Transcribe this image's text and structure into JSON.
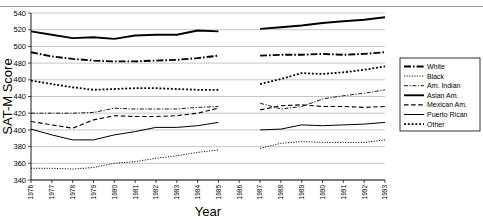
{
  "page": {
    "partial_caption_top": ""
  },
  "axes": {
    "ylabel": "SAT-M Score",
    "xlabel": "Year",
    "ylim": [
      340,
      540
    ],
    "yticks": [
      340,
      360,
      380,
      400,
      420,
      440,
      460,
      480,
      500,
      520,
      540
    ],
    "xticks": [
      "1976",
      "1977",
      "1978",
      "1979",
      "1980",
      "1981",
      "1982",
      "1983",
      "1984",
      "1985",
      "1986",
      "1987",
      "1988",
      "1989",
      "1990",
      "1991",
      "1992",
      "1993"
    ]
  },
  "legend": {
    "position": "right",
    "items": [
      {
        "label": "White",
        "style": "dash-dot-thick"
      },
      {
        "label": "Black",
        "style": "dotted-fine"
      },
      {
        "label": "Am. Indian",
        "style": "dash-dot-thin"
      },
      {
        "label": "Asian Am.",
        "style": "solid-thick"
      },
      {
        "label": "Mexican Am.",
        "style": "dashed"
      },
      {
        "label": "Puerto Rican",
        "style": "solid-thin"
      },
      {
        "label": "Other",
        "style": "dotted-square"
      }
    ]
  },
  "chart_data": {
    "type": "line",
    "title": "",
    "xlabel": "Year",
    "ylabel": "SAT-M Score",
    "ylim": [
      340,
      540
    ],
    "grid": true,
    "legend_position": "right",
    "x": [
      1976,
      1977,
      1978,
      1979,
      1980,
      1981,
      1982,
      1983,
      1984,
      1985,
      1986,
      1987,
      1988,
      1989,
      1990,
      1991,
      1992,
      1993
    ],
    "note": "No data collected for 1986 (gap in all series).",
    "series": [
      {
        "name": "White",
        "values": [
          493,
          488,
          485,
          483,
          482,
          482,
          483,
          484,
          486,
          489,
          null,
          489,
          490,
          490,
          491,
          490,
          491,
          493
        ]
      },
      {
        "name": "Black",
        "values": [
          354,
          354,
          353,
          355,
          360,
          362,
          366,
          369,
          373,
          376,
          null,
          378,
          384,
          386,
          385,
          385,
          385,
          388
        ]
      },
      {
        "name": "Am. Indian",
        "values": [
          420,
          420,
          420,
          421,
          426,
          425,
          425,
          425,
          427,
          428,
          null,
          432,
          425,
          428,
          437,
          441,
          444,
          448
        ]
      },
      {
        "name": "Asian Am.",
        "values": [
          518,
          514,
          510,
          511,
          509,
          513,
          514,
          514,
          519,
          518,
          null,
          521,
          523,
          525,
          528,
          530,
          532,
          535
        ]
      },
      {
        "name": "Mexican Am.",
        "values": [
          410,
          406,
          402,
          412,
          417,
          416,
          416,
          417,
          420,
          426,
          null,
          424,
          429,
          430,
          428,
          428,
          427,
          428
        ]
      },
      {
        "name": "Puerto Rican",
        "values": [
          401,
          394,
          388,
          388,
          394,
          398,
          403,
          403,
          405,
          409,
          null,
          400,
          401,
          406,
          405,
          406,
          407,
          409
        ]
      },
      {
        "name": "Other",
        "values": [
          459,
          455,
          451,
          448,
          449,
          450,
          450,
          449,
          448,
          448,
          null,
          455,
          461,
          468,
          467,
          469,
          472,
          476
        ]
      }
    ]
  }
}
